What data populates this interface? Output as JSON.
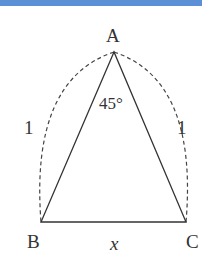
{
  "figure": {
    "header_bar_color": "#5b8fd6",
    "vertices": {
      "A": "A",
      "B": "B",
      "C": "C"
    },
    "angle_label": "45°",
    "side_AB_label": "1",
    "side_AC_label": "1",
    "base_label": "x"
  }
}
